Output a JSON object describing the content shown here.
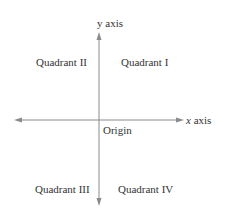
{
  "diagram": {
    "axes": {
      "x_label_var": "x",
      "x_label_word": "axis",
      "y_label": "y axis"
    },
    "origin_label": "Origin",
    "quadrants": [
      {
        "id": "I",
        "label": "Quadrant I"
      },
      {
        "id": "II",
        "label": "Quadrant II"
      },
      {
        "id": "III",
        "label": "Quadrant III"
      },
      {
        "id": "IV",
        "label": "Quadrant IV"
      }
    ],
    "colors": {
      "axis": "#8a8a8a",
      "text": "#333333"
    }
  }
}
